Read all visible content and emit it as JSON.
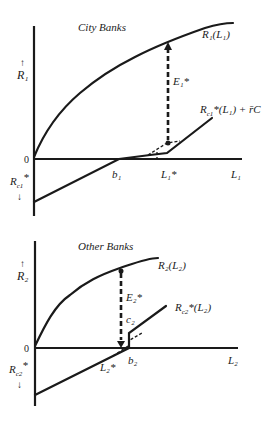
{
  "panels": [
    {
      "title": "City Banks",
      "y_axis_label": "R₁",
      "y_axis_arrow": "↑",
      "origin_label": "0",
      "neg_axis_label": "R",
      "neg_axis_sub": "c1",
      "neg_axis_star": "*",
      "neg_axis_arrow": "↓",
      "x_axis_label": "L₁",
      "curve_label": "R₁(L₁)",
      "line_label": "R",
      "line_label_sub": "c1",
      "line_label_rest": "*(L₁) + r̄C",
      "gap_label": "E₁*",
      "b_label": "b₁",
      "opt_label": "L₁*"
    },
    {
      "title": "Other Banks",
      "y_axis_label": "R₂",
      "y_axis_arrow": "↑",
      "origin_label": "0",
      "neg_axis_label": "R",
      "neg_axis_sub": "c2",
      "neg_axis_star": "*",
      "neg_axis_arrow": "↓",
      "x_axis_label": "L₂",
      "curve_label": "R₂(L₂)",
      "line_label": "R",
      "line_label_sub": "c2",
      "line_label_rest": "*(L₂)",
      "gap_label": "E₂*",
      "c_label": "c₂",
      "b_label": "b₂",
      "opt_label": "L₂*"
    }
  ]
}
